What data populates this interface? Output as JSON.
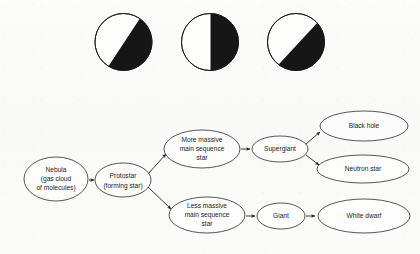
{
  "page": {
    "background_color": "#fbfbfa",
    "ink_color": "#1c1c1c"
  },
  "moon_phase_diagram": {
    "name": "moon-phase-row",
    "count": 3,
    "circles": [
      {
        "id": "phase-1",
        "label": "waxing-crescent-to-gibbous",
        "cx": 123.5,
        "cy": 42,
        "r": 28.5,
        "terminator": "diagonal",
        "terminator_angle_deg": 28,
        "dark_side": "upper-right",
        "dark_color": "#161616",
        "light_color": "#fdfdfc"
      },
      {
        "id": "phase-2",
        "label": "half-moon-vertical",
        "cx": 210,
        "cy": 42,
        "r": 28.5,
        "terminator": "vertical",
        "terminator_angle_deg": 0,
        "dark_side": "right",
        "dark_color": "#161616",
        "light_color": "#fdfdfc"
      },
      {
        "id": "phase-3",
        "label": "steep-diagonal-gibbous",
        "cx": 296,
        "cy": 42,
        "r": 28.5,
        "terminator": "diagonal",
        "terminator_angle_deg": 52,
        "dark_side": "lower-right",
        "dark_color": "#161616",
        "light_color": "#fdfdfc"
      }
    ]
  },
  "flowchart": {
    "name": "stellar-life-cycle-flowchart",
    "nodes": [
      {
        "id": "nebula",
        "lines": [
          "Nebula",
          "(gas cloud",
          "of molecules)"
        ],
        "cx": 56,
        "cy": 179,
        "rx": 32,
        "ry": 22
      },
      {
        "id": "protostar",
        "lines": [
          "Protostar",
          "(forming star)"
        ],
        "cx": 123,
        "cy": 180,
        "rx": 28,
        "ry": 17
      },
      {
        "id": "more-massive-main-sequence-star",
        "lines": [
          "More massive",
          "main sequence",
          "star"
        ],
        "cx": 202,
        "cy": 149,
        "rx": 38,
        "ry": 19
      },
      {
        "id": "less-massive-main-sequence-star",
        "lines": [
          "Less massive",
          "main sequence",
          "star"
        ],
        "cx": 207,
        "cy": 215,
        "rx": 38,
        "ry": 18
      },
      {
        "id": "supergiant",
        "lines": [
          "Supergiant"
        ],
        "cx": 280,
        "cy": 149,
        "rx": 28,
        "ry": 13
      },
      {
        "id": "giant",
        "lines": [
          "Giant"
        ],
        "cx": 281,
        "cy": 216,
        "rx": 24,
        "ry": 13
      },
      {
        "id": "black-hole",
        "lines": [
          "Black hole"
        ],
        "cx": 364,
        "cy": 126,
        "rx": 44,
        "ry": 15
      },
      {
        "id": "neutron-star",
        "lines": [
          "Neutron star"
        ],
        "cx": 363,
        "cy": 169,
        "rx": 46,
        "ry": 14
      },
      {
        "id": "white-dwarf",
        "lines": [
          "White dwarf"
        ],
        "cx": 364,
        "cy": 216,
        "rx": 46,
        "ry": 17
      }
    ],
    "edges": [
      {
        "id": "nebula-to-protostar",
        "from": "nebula",
        "to": "protostar"
      },
      {
        "id": "protostar-to-more-massive",
        "from": "protostar",
        "to": "more-massive-main-sequence-star"
      },
      {
        "id": "protostar-to-less-massive",
        "from": "protostar",
        "to": "less-massive-main-sequence-star"
      },
      {
        "id": "more-massive-to-supergiant",
        "from": "more-massive-main-sequence-star",
        "to": "supergiant"
      },
      {
        "id": "supergiant-to-black-hole",
        "from": "supergiant",
        "to": "black-hole"
      },
      {
        "id": "supergiant-to-neutron-star",
        "from": "supergiant",
        "to": "neutron-star"
      },
      {
        "id": "less-massive-to-giant",
        "from": "less-massive-main-sequence-star",
        "to": "giant"
      },
      {
        "id": "giant-to-white-dwarf",
        "from": "giant",
        "to": "white-dwarf"
      }
    ]
  }
}
